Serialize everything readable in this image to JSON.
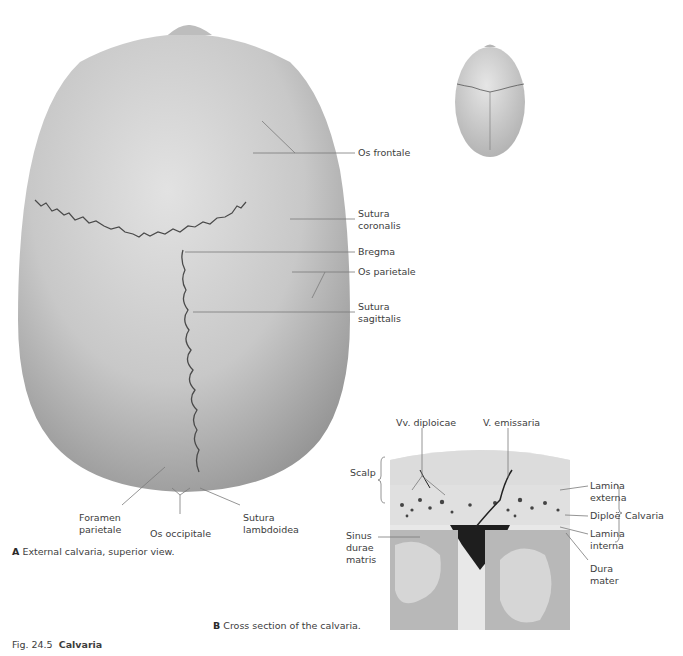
{
  "figure": {
    "number": "Fig. 24.5",
    "title": "Calvaria"
  },
  "panel_a": {
    "letter": "A",
    "caption": "External calvaria, superior view.",
    "labels": {
      "os_frontale": "Os frontale",
      "sutura_coronalis_1": "Sutura",
      "sutura_coronalis_2": "coronalis",
      "bregma": "Bregma",
      "os_parietale": "Os parietale",
      "sutura_sagittalis_1": "Sutura",
      "sutura_sagittalis_2": "sagittalis",
      "foramen_parietale_1": "Foramen",
      "foramen_parietale_2": "parietale",
      "os_occipitale": "Os occipitale",
      "sutura_lambdoidea_1": "Sutura",
      "sutura_lambdoidea_2": "lambdoidea"
    }
  },
  "panel_b": {
    "letter": "B",
    "caption": "Cross section of the calvaria.",
    "labels": {
      "vv_diploicae": "Vv. diploicae",
      "v_emissaria": "V. emissaria",
      "scalp": "Scalp",
      "lamina_externa_1": "Lamina",
      "lamina_externa_2": "externa",
      "diploe": "Diploë",
      "calvaria": "Calvaria",
      "lamina_interna_1": "Lamina",
      "lamina_interna_2": "interna",
      "sinus_1": "Sinus",
      "sinus_2": "durae",
      "sinus_3": "matris",
      "dura_1": "Dura",
      "dura_2": "mater"
    }
  },
  "colors": {
    "bone": "#c9c9c9",
    "suture": "#4a4a4a",
    "leader_line": "#7a7a7a",
    "text": "#3d3d3d"
  }
}
